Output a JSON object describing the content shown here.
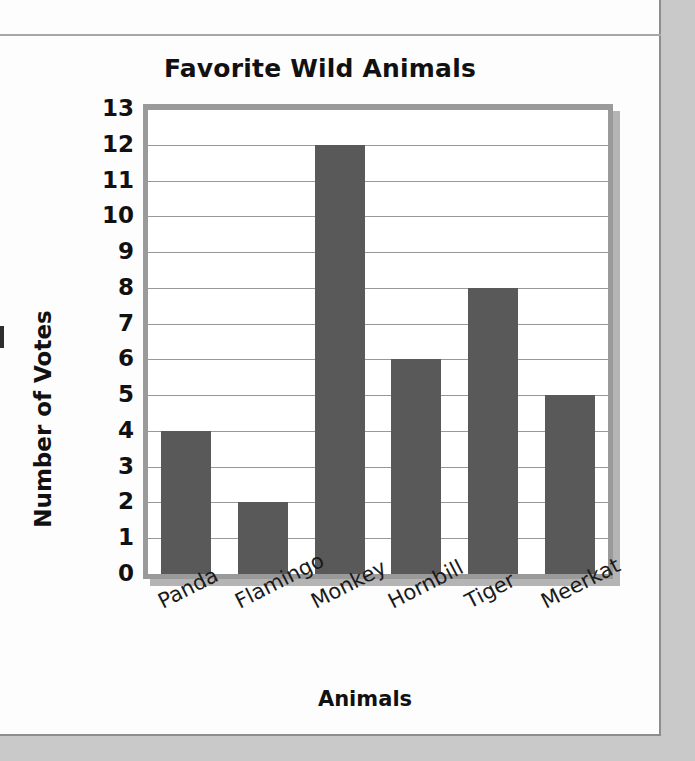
{
  "chart_data": {
    "type": "bar",
    "title": "Favorite Wild Animals",
    "xlabel": "Animals",
    "ylabel": "Number of Votes",
    "categories": [
      "Panda",
      "Flamingo",
      "Monkey",
      "Hornbill",
      "Tiger",
      "Meerkat"
    ],
    "values": [
      4,
      2,
      12,
      6,
      8,
      5
    ],
    "ylim": [
      0,
      13
    ],
    "ytick_labels": [
      "0",
      "1",
      "2",
      "3",
      "4",
      "5",
      "6",
      "7",
      "8",
      "9",
      "10",
      "11",
      "12",
      "13"
    ],
    "ytick_step": 1,
    "grid": "horizontal",
    "legend": "none",
    "bar_color": "#595959",
    "gridline_color": "#999999",
    "frame_color": "#9a9a9a",
    "text_color": "#111111",
    "xtick_rotation_deg": -27
  }
}
